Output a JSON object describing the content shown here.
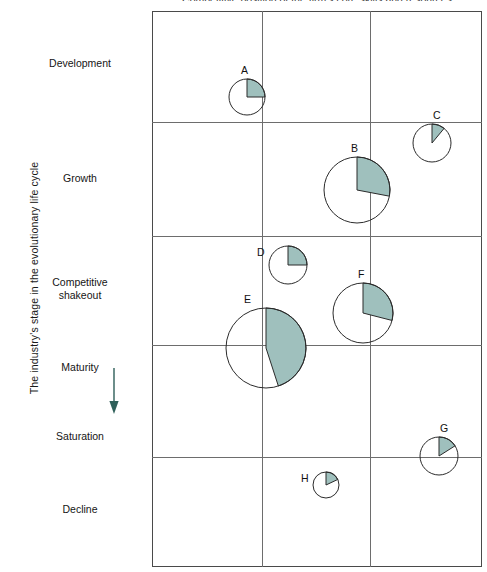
{
  "chart_data": {
    "type": "scatter",
    "title": "Competitive position of the firm's core skills and resources",
    "xlabel": "Competitive position of the firm's core skills and resources",
    "ylabel": "The industry's stage in the evolutionary life cycle",
    "grid": true,
    "legend": null,
    "shaded_color": "#9fc0bd",
    "outline_color": "#2b2b2b",
    "y_categories": [
      "Development",
      "Growth",
      "Competitive\nshakeout",
      "Maturity",
      "Saturation",
      "Decline"
    ],
    "x_bands": 3,
    "y_bands": 5,
    "note_arrow": "Maturity to Saturation",
    "bubbles": [
      {
        "label": "A",
        "x": 247,
        "y": 97,
        "r": 18,
        "share": 0.25
      },
      {
        "label": "B",
        "x": 357,
        "y": 190,
        "r": 33,
        "share": 0.28
      },
      {
        "label": "C",
        "x": 432,
        "y": 143,
        "r": 19,
        "share": 0.11
      },
      {
        "label": "D",
        "x": 288,
        "y": 265,
        "r": 19,
        "share": 0.25
      },
      {
        "label": "E",
        "x": 266,
        "y": 348,
        "r": 40,
        "share": 0.45
      },
      {
        "label": "F",
        "x": 363,
        "y": 313,
        "r": 30,
        "share": 0.29
      },
      {
        "label": "G",
        "x": 439,
        "y": 456,
        "r": 19,
        "share": 0.16
      },
      {
        "label": "H",
        "x": 326,
        "y": 485,
        "r": 13,
        "share": 0.18
      }
    ],
    "gridlines": {
      "left": 152,
      "right": 482,
      "top": 11,
      "bottom": 567,
      "verticals": [
        262,
        370
      ],
      "horizontals": [
        122,
        236,
        345,
        457
      ]
    }
  },
  "axis": {
    "vertical_label": "The industry's stage in the evolutionary life cycle"
  },
  "stages": [
    {
      "name": "stage-development",
      "label": "Development",
      "top": 57
    },
    {
      "name": "stage-growth",
      "label": "Growth",
      "top": 172
    },
    {
      "name": "stage-shakeout",
      "label": "Competitive\nshakeout",
      "top": 276
    },
    {
      "name": "stage-maturity",
      "label": "Maturity",
      "top": 361
    },
    {
      "name": "stage-saturation",
      "label": "Saturation",
      "top": 430
    },
    {
      "name": "stage-decline",
      "label": "Decline",
      "top": 503
    }
  ],
  "bubble_labels": {
    "A": "A",
    "B": "B",
    "C": "C",
    "D": "D",
    "E": "E",
    "F": "F",
    "G": "G",
    "H": "H"
  },
  "colors": {
    "shaded": "#9fc0bd",
    "outline": "#2b2b2b",
    "grid": "#6d6d6d",
    "border": "#4a4a4a",
    "arrow": "#2e5f59",
    "text": "#111111"
  }
}
